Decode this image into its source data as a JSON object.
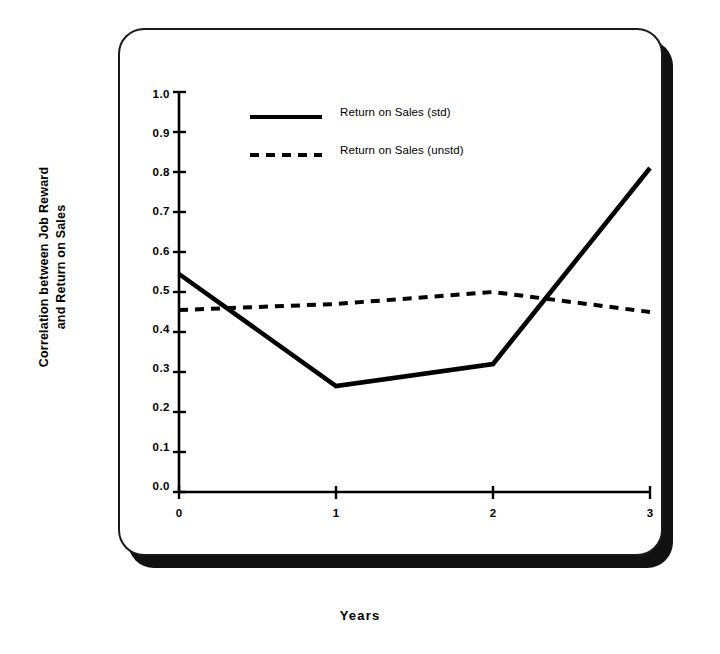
{
  "chart_data": {
    "type": "line",
    "title": "",
    "xlabel": "Years",
    "ylabel_line1": "Correlation between Job Reward",
    "ylabel_line2": "and Return on Sales",
    "x": [
      0,
      1,
      2,
      3
    ],
    "xticklabels": [
      "0",
      "1",
      "2",
      "3"
    ],
    "xlim": [
      0,
      3
    ],
    "ylim": [
      0.0,
      1.0
    ],
    "yticks": [
      0.0,
      0.1,
      0.2,
      0.3,
      0.4,
      0.5,
      0.6,
      0.7,
      0.8,
      0.9,
      1.0
    ],
    "yticklabels": [
      "0.0",
      "0.1",
      "0.2",
      "0.3",
      "0.4",
      "0.5",
      "0.6",
      "0.7",
      "0.8",
      "0.9",
      "1.0"
    ],
    "grid": false,
    "legend_position": "upper center",
    "series": [
      {
        "name": "Return on Sales (std)",
        "style": "solid",
        "color": "#000000",
        "values": [
          0.545,
          0.265,
          0.32,
          0.81
        ]
      },
      {
        "name": "Return on Sales (unstd)",
        "style": "dashed",
        "color": "#000000",
        "values": [
          0.455,
          0.47,
          0.5,
          0.45
        ]
      }
    ]
  },
  "axes": {
    "ylabel_line1": "Correlation between Job Reward",
    "ylabel_line2": "and Return on Sales",
    "xlabel": "Years",
    "yticklabels": [
      "1.0",
      "0.9",
      "0.8",
      "0.7",
      "0.6",
      "0.5",
      "0.4",
      "0.3",
      "0.2",
      "0.1",
      "0.0"
    ],
    "xticklabels": [
      "0",
      "1",
      "2",
      "3"
    ]
  },
  "legend": {
    "entries": [
      {
        "label": "Return on Sales (std)",
        "style": "solid"
      },
      {
        "label": "Return on Sales (unstd)",
        "style": "dashed"
      }
    ]
  }
}
